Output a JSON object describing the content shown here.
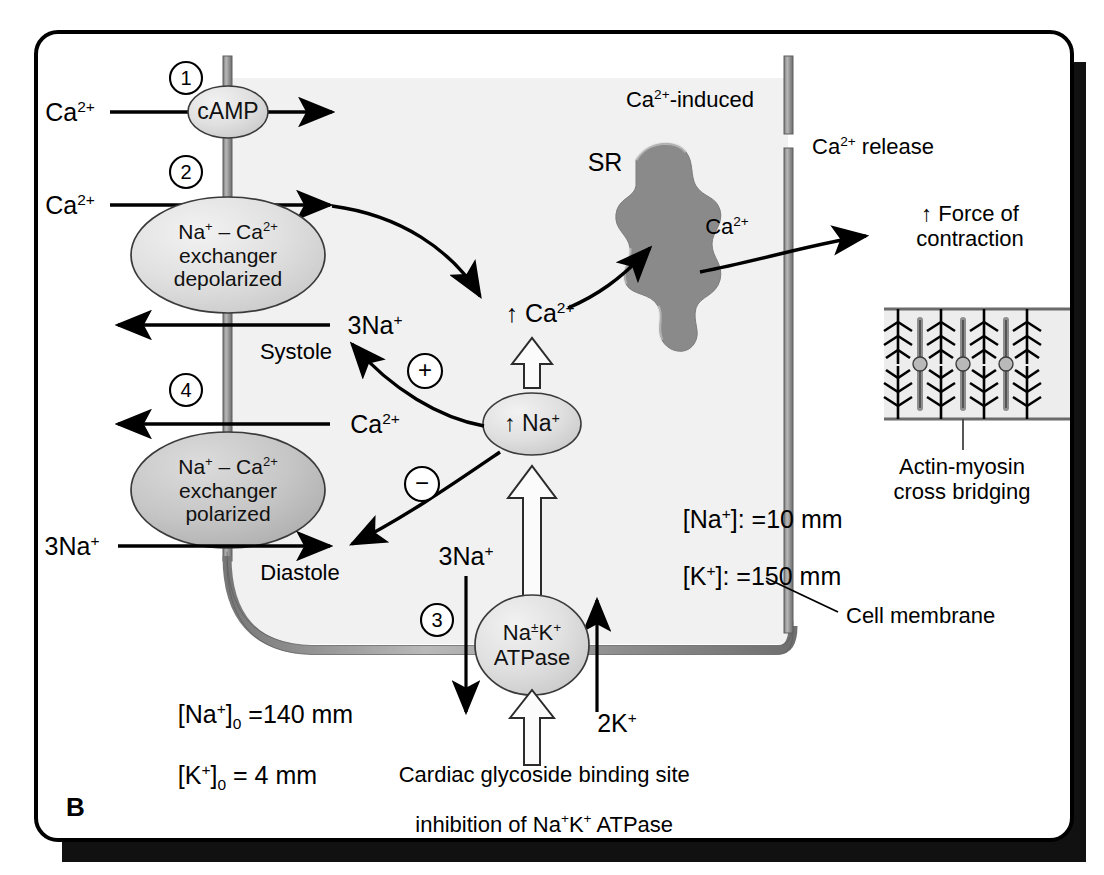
{
  "figure": {
    "panel_letter": "B",
    "type": "biological-pathway-diagram"
  },
  "colors": {
    "outline": "#000000",
    "membrane": "#8c8c8c",
    "node_fill_light": "#e3e3e3",
    "node_fill_dark": "#bfbfbf",
    "sr_fill": "#8a8a8a",
    "cytosol": "#f1f1f1",
    "sarcomere_bg": "#ededed",
    "shadow": "#111111"
  },
  "steps": [
    {
      "id": "step-1",
      "label": "1"
    },
    {
      "id": "step-2",
      "label": "2"
    },
    {
      "id": "step-3",
      "label": "3"
    },
    {
      "id": "step-4",
      "label": "4"
    }
  ],
  "nodes": {
    "camp": "cAMP",
    "exchanger_depolarized": {
      "line1": "Na+ – Ca2+",
      "line2": "exchanger",
      "line3": "depolarized"
    },
    "exchanger_polarized": {
      "line1": "Na+ – Ca2+",
      "line2": "exchanger",
      "line3": "polarized"
    },
    "na_k_atpase": {
      "line1": "Na±K+",
      "line2": "ATPase"
    },
    "na_increase": "↑ Na+",
    "ca_increase": "↑ Ca2+",
    "plus_sign": "+",
    "minus_sign": "−"
  },
  "labels": {
    "ca_in_1": "Ca2+",
    "ca_in_2": "Ca2+",
    "na_out_systole": "3Na+",
    "ca_out_4": "Ca2+",
    "na_in_diastole": "3Na+",
    "systole": "Systole",
    "diastole": "Diastole",
    "sr": "SR",
    "ca_induced": "Ca2+-induced",
    "ca_release": "Ca2+ release",
    "ca_to_force": "Ca2+",
    "force_of_contraction_l1": "↑ Force of",
    "force_of_contraction_l2": "contraction",
    "actin_myosin_l1": "Actin-myosin",
    "actin_myosin_l2": "cross bridging",
    "cell_membrane": "Cell membrane",
    "na_pump_out": "3Na+",
    "k_pump_in": "2K+",
    "glycoside_l1": "Cardiac glycoside binding site",
    "glycoside_l2": "inhibition of Na+K+ ATPase"
  },
  "concentrations": {
    "intracellular": [
      {
        "species": "[Na+]:",
        "value": "=10 mm"
      },
      {
        "species": "[K+]:",
        "value": "=150 mm"
      }
    ],
    "extracellular": [
      {
        "species": "[Na+]0",
        "value": "=140 mm"
      },
      {
        "species": "[K+]0",
        "value": "= 4 mm"
      }
    ]
  }
}
